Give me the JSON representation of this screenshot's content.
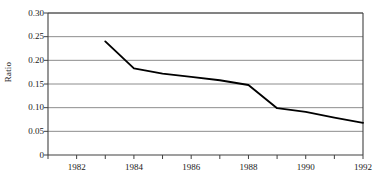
{
  "chart_data": {
    "type": "line",
    "title": "",
    "xlabel": "",
    "ylabel": "Ratio",
    "x": [
      1983,
      1984,
      1985,
      1986,
      1987,
      1988,
      1989,
      1990,
      1991,
      1992
    ],
    "values": [
      0.24,
      0.183,
      0.172,
      0.165,
      0.158,
      0.148,
      0.099,
      0.091,
      0.079,
      0.068
    ],
    "series": [
      {
        "name": "Ratio",
        "values": [
          0.24,
          0.183,
          0.172,
          0.165,
          0.158,
          0.148,
          0.099,
          0.091,
          0.079,
          0.068
        ]
      }
    ],
    "xlim": [
      1981.0,
      1992.0
    ],
    "ylim": [
      0,
      0.3
    ],
    "xtick_labels": [
      "1982",
      "1984",
      "1986",
      "1988",
      "1990",
      "1992"
    ],
    "xtick_values": [
      1982,
      1984,
      1986,
      1988,
      1990,
      1992
    ],
    "xtick_minor_values": [
      1981,
      1983,
      1985,
      1987,
      1989,
      1991
    ],
    "ytick_labels": [
      "0.30",
      "0.25",
      "0.20",
      "0.15",
      "0.10",
      "0.05",
      "0"
    ],
    "ytick_values": [
      0.3,
      0.25,
      0.2,
      0.15,
      0.1,
      0.05,
      0
    ],
    "grid": "horizontal",
    "legend": "none",
    "line_color": "#000000",
    "grid_color": "#808080",
    "axis_color": "#404040",
    "background_color": "#ffffff"
  }
}
